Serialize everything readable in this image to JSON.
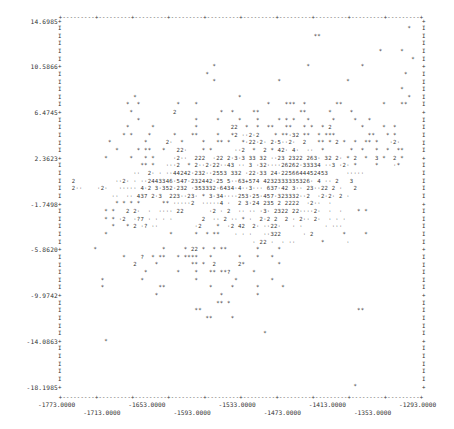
{
  "chart_data": {
    "type": "scatter",
    "title": "",
    "xlabel": "",
    "ylabel": "",
    "xlim": [
      -1773.0,
      -1293.0
    ],
    "ylim": [
      -18.1985,
      14.6985
    ],
    "x_ticks": [
      "-1773.0000",
      "-1713.0000",
      "-1653.0000",
      "-1593.0000",
      "-1533.0000",
      "-1473.0000",
      "-1413.0000",
      "-1353.0000",
      "-1293.0000"
    ],
    "y_ticks": [
      "14.6985",
      "10.5866",
      "6.4745",
      "2.3623",
      "-1.7498",
      "-5.8620",
      "-9.9742",
      "-14.0863",
      "-18.1985"
    ],
    "legend": [],
    "grid": false,
    "rows": [
      "",
      "                                                                                                *   ",
      "                                                                      **                            ",
      "                                                                                                    ",
      "                                                                                        *     *     ",
      "                                                                                                 *  ",
      "                                          *                         *              *                ",
      "                                        *                                                      *    ",
      "                                          *                 *                  *                    ",
      "                                                                                              *     ",
      "                    *                            *                                              *   ",
      "                  *  *          *    *                   *    ***  *        **           *    **   ",
      "                   *           2            *  *     **           **      *     *                 ",
      "                     *               *     *     *    *     * * *   *      *     *   *            ",
      "                  *      *           *         22  *  *  **   **   * *  * 2        *     *  *     ",
      "                 * *    *      *    **     *   *2 ..2.2    * **.32 **  * ***         **   * *     ",
      "             *         *     2.  *     *   ** *   *.22.2. 2.5..2.  2   ** * 2 *  *  ** *   .2.   ",
      "               *     * **   *   22.    * *      ..2  *  2 * 42. 4.  ..  *       *  *   *  *  **  ",
      "            *      *   * *     .2..  222  .22 2.3.3 33 32 ..23 2322 263. 32 2. * 2  *  3 *  2 *  ",
      "                      ** *   ...2  * 2..2.22..43 .. 3 .32....26262.33334 ..3 .2. *     *    .*    ",
      "                    ..  2. . ..44242.232..2553 332 .22.33 24.2256644452453     .....            ",
      "   2           ..2. . ..2443346.547.232442.25 5..63+574 4232333335326. 4 .. 2   3              ",
      "   2..    .2.   ..... 4.2 3.352.232 .353332.6434.4..3... 637.42 3.. 23..22 2 .   2             ",
      "              ..  .. 437 2.3  223..23. * 3.34....253.25.457.323332..2  .2.2. 2 .              ",
      "               * * * *      ** .....2  .....4 .  2 3.24 235 2 2222  .2..  .                  ",
      "            * *   2 2.  .  .... 22       .2 . 2  .. .. .3. 2322 22....2.  .  .    * *        ",
      "            * * .2  .?7 . . . .        2  .. 2 .. * .  2.2 2  2 . 2.. 2.  . . .               ",
      "              *   * 2 .? ..          .2    *  .2 42  2. ..22.   . .      . ...               ",
      "            *                 *      *  * **    . . .   ..322      . 2        *     *         ",
      "                                                     . 22 .  . ..       *      .               ",
      "         *                  *     * 22 *  * **        *     *                                 ",
      "                 *    ?  * **   * ****   *       *    *   *                                   ",
      "                    2     *         ** *  2      2*         *                                  ",
      "                       *        *    *   ** **?      *                                         ",
      "           *          *              *          *         *                                   ",
      "           *               **            *     *      *      *                                ",
      "                          *                 *         *                                        ",
      "                                           ** *                                                ",
      "                                     **                                           **          ",
      "                                        **     *                                               ",
      "                                                                                               ",
      "                                                        *                                      ",
      "            *                                                                                  ",
      "                                                                                               ",
      "                                                                                               ",
      "                                                                                               ",
      "                                                                                               ",
      "                                                                                               ",
      "                                                                                 *             "
    ]
  },
  "axes": {
    "top_border": "+---------+---------+---------+---------+---------+---------+---------+---------+---------+----",
    "bottom_border": "+---------+---------+---------+---------+---------+---------+---------+---------+---------+----"
  }
}
